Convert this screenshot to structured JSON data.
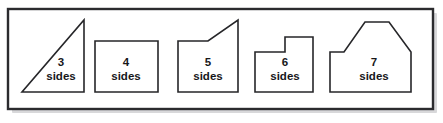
{
  "figure": {
    "frame": {
      "x": 8,
      "y": 9,
      "width": 425,
      "height": 100,
      "border_color": "#2b2b2e",
      "fill_color": "#ffffff",
      "shadow_color": "#b8b8bb"
    },
    "shapes": [
      {
        "id": "triangle",
        "name": "right-triangle",
        "sides": 3,
        "count_label": "3",
        "word_label": "sides",
        "label_x": 61,
        "label_count_y": 66,
        "label_word_y": 80,
        "points": "22,92 84,92 84,20",
        "stroke_color": "#262629",
        "fill_color": "#ffffff"
      },
      {
        "id": "quadrilateral",
        "name": "rectangle",
        "sides": 4,
        "count_label": "4",
        "word_label": "sides",
        "label_x": 126,
        "label_count_y": 66,
        "label_word_y": 80,
        "points": "95,41 158,41 158,92 95,92",
        "stroke_color": "#262629",
        "fill_color": "#ffffff"
      },
      {
        "id": "pentagon",
        "name": "pentagon-sloped-top",
        "sides": 5,
        "count_label": "5",
        "word_label": "sides",
        "label_x": 208,
        "label_count_y": 66,
        "label_word_y": 80,
        "points": "178,41 208,41 238,20 238,92 178,92",
        "stroke_color": "#262629",
        "fill_color": "#ffffff"
      },
      {
        "id": "hexagon",
        "name": "hexagon-step",
        "sides": 6,
        "count_label": "6",
        "word_label": "sides",
        "label_x": 285,
        "label_count_y": 66,
        "label_word_y": 80,
        "points": "255,52 285,52 285,37 313,37 313,92 255,92",
        "stroke_color": "#262629",
        "fill_color": "#ffffff"
      },
      {
        "id": "heptagon",
        "name": "heptagon-house",
        "sides": 7,
        "count_label": "7",
        "word_label": "sides",
        "label_x": 374,
        "label_count_y": 66,
        "label_word_y": 80,
        "points": "330,52 344,52 365,22 389,22 411,52 411,92 330,92",
        "stroke_color": "#262629",
        "fill_color": "#ffffff"
      }
    ]
  }
}
